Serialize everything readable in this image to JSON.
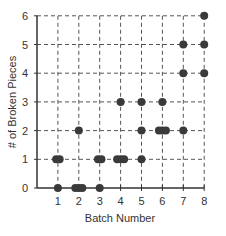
{
  "chart_data": {
    "type": "scatter",
    "title": "",
    "xlabel": "Batch Number",
    "ylabel": "# of Broken Pieces",
    "xlim": [
      0,
      8
    ],
    "ylim": [
      0,
      6
    ],
    "x_ticks": [
      "1",
      "2",
      "3",
      "4",
      "5",
      "6",
      "7",
      "8"
    ],
    "y_ticks": [
      "0",
      "1",
      "2",
      "3",
      "4",
      "5",
      "6"
    ],
    "grid": true,
    "grid_style": "dashed",
    "marker_color": "#3a3a3a",
    "points": [
      {
        "x": 1,
        "y": 0
      },
      {
        "x": 1,
        "y": 1
      },
      {
        "x": 1,
        "y": 1
      },
      {
        "x": 2,
        "y": 0
      },
      {
        "x": 2,
        "y": 0
      },
      {
        "x": 2,
        "y": 0
      },
      {
        "x": 2,
        "y": 2
      },
      {
        "x": 3,
        "y": 0
      },
      {
        "x": 3,
        "y": 1
      },
      {
        "x": 3,
        "y": 1
      },
      {
        "x": 4,
        "y": 1
      },
      {
        "x": 4,
        "y": 1
      },
      {
        "x": 4,
        "y": 1
      },
      {
        "x": 4,
        "y": 3
      },
      {
        "x": 5,
        "y": 1
      },
      {
        "x": 5,
        "y": 2
      },
      {
        "x": 5,
        "y": 3
      },
      {
        "x": 6,
        "y": 2
      },
      {
        "x": 6,
        "y": 2
      },
      {
        "x": 6,
        "y": 2
      },
      {
        "x": 6,
        "y": 3
      },
      {
        "x": 7,
        "y": 2
      },
      {
        "x": 7,
        "y": 4
      },
      {
        "x": 7,
        "y": 5
      },
      {
        "x": 8,
        "y": 4
      },
      {
        "x": 8,
        "y": 5
      },
      {
        "x": 8,
        "y": 6
      }
    ]
  }
}
